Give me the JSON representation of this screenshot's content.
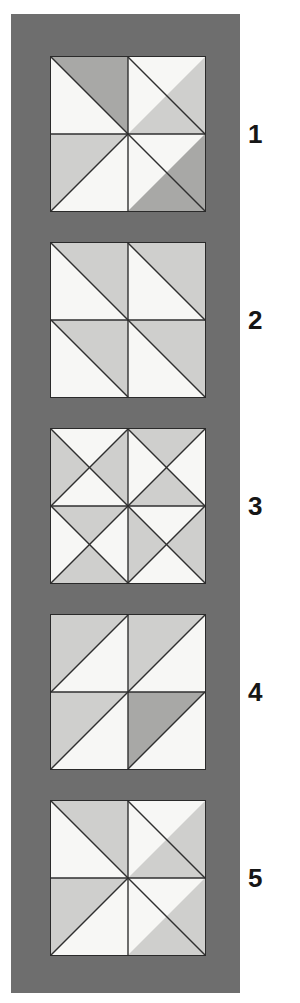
{
  "page": {
    "background_color": "#ffffff",
    "panel_color": "#6e6e6e",
    "tile_border_color": "#2a2a2a",
    "light_color": "#f2f2f0",
    "mid_color": "#c9c9c7",
    "dark_color": "#a0a0a0"
  },
  "figure": {
    "type": "tile-pattern-sequence",
    "tile_count": 5,
    "tile_grid": "2x2 quadrants",
    "labels": [
      "1",
      "2",
      "3",
      "4",
      "5"
    ]
  },
  "tiles": [
    {
      "label": "1",
      "name": "pattern-1-pinwheel",
      "top": 56,
      "quadrants": [
        {
          "position": "top-left",
          "split": "tl-br",
          "upper_right": "dark",
          "lower_left": "light"
        },
        {
          "position": "top-right",
          "split": "bl-tr",
          "upper_left": "light",
          "lower_right": "mid"
        },
        {
          "position": "bottom-left",
          "split": "bl-tr",
          "upper_left": "mid",
          "lower_right": "light"
        },
        {
          "position": "bottom-right",
          "split": "tl-br",
          "upper_right": "light",
          "lower_left": "dark"
        }
      ]
    },
    {
      "label": "2",
      "name": "pattern-2-parallel-diagonals",
      "top": 242,
      "quadrants": [
        {
          "position": "top-left",
          "split": "tl-br",
          "upper_right": "mid",
          "lower_left": "light"
        },
        {
          "position": "top-right",
          "split": "tl-br",
          "upper_right": "mid",
          "lower_left": "light"
        },
        {
          "position": "bottom-left",
          "split": "tl-br",
          "upper_right": "mid",
          "lower_left": "light"
        },
        {
          "position": "bottom-right",
          "split": "tl-br",
          "upper_right": "mid",
          "lower_left": "light"
        }
      ]
    },
    {
      "label": "3",
      "name": "pattern-3-hourglass-x",
      "top": 428,
      "quadrants": [
        {
          "position": "top-left",
          "split": "x",
          "north": "light",
          "east": "mid",
          "south": "light",
          "west": "mid"
        },
        {
          "position": "top-right",
          "split": "x",
          "north": "mid",
          "east": "light",
          "south": "mid",
          "west": "light"
        },
        {
          "position": "bottom-left",
          "split": "x",
          "north": "mid",
          "east": "light",
          "south": "mid",
          "west": "light"
        },
        {
          "position": "bottom-right",
          "split": "x",
          "north": "light",
          "east": "mid",
          "south": "light",
          "west": "mid"
        }
      ]
    },
    {
      "label": "4",
      "name": "pattern-4-parallel-diagonals-mirrored",
      "top": 614,
      "quadrants": [
        {
          "position": "top-left",
          "split": "tl-br",
          "upper_left": "mid",
          "lower_right": "light"
        },
        {
          "position": "top-right",
          "split": "tl-br",
          "upper_left": "mid",
          "lower_right": "light"
        },
        {
          "position": "bottom-left",
          "split": "tl-br",
          "upper_left": "mid",
          "lower_right": "light"
        },
        {
          "position": "bottom-right",
          "split": "tl-br",
          "upper_left": "dark",
          "lower_right": "light"
        }
      ]
    },
    {
      "label": "5",
      "name": "pattern-5-pinwheel",
      "top": 800,
      "quadrants": [
        {
          "position": "top-left",
          "split": "tl-br",
          "upper_right": "mid",
          "lower_left": "light"
        },
        {
          "position": "top-right",
          "split": "bl-tr",
          "upper_left": "light",
          "lower_right": "mid"
        },
        {
          "position": "bottom-left",
          "split": "bl-tr",
          "upper_left": "mid",
          "lower_right": "light"
        },
        {
          "position": "bottom-right",
          "split": "tl-br",
          "upper_right": "light",
          "lower_left": "mid"
        }
      ]
    }
  ],
  "label_offsets": [
    125,
    311,
    497,
    683,
    869
  ]
}
